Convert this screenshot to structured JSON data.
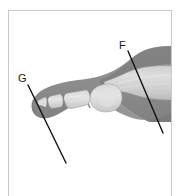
{
  "figure": {
    "caption_top": "",
    "type": "radiograph",
    "view": "lateral",
    "anatomy": "foot / toe - metatarsal and phalanges"
  },
  "frame": {
    "border_color": "#c9c9c9",
    "background_color": "#ffffff"
  },
  "labels": [
    {
      "id": "F",
      "text": "F",
      "x": 119,
      "y": 40,
      "leader_line": {
        "x1": 128,
        "y1": 51,
        "x2": 163,
        "y2": 133,
        "color": "#111111",
        "width": 1.4
      }
    },
    {
      "id": "G",
      "text": "G",
      "x": 18,
      "y": 73,
      "leader_line": {
        "x1": 28,
        "y1": 85,
        "x2": 66,
        "y2": 163,
        "color": "#111111",
        "width": 1.4
      }
    }
  ],
  "xray": {
    "soft_tissue_color": "#8a8a8a",
    "soft_tissue_edge_color": "#9c9c9c",
    "bone_color": "#cfcfcf",
    "bone_highlight_color": "#e2e2e2",
    "bone_outline_color": "#7e7e7e",
    "joint_gap_color": "#7a7a7a",
    "background_color": "#ffffff"
  }
}
